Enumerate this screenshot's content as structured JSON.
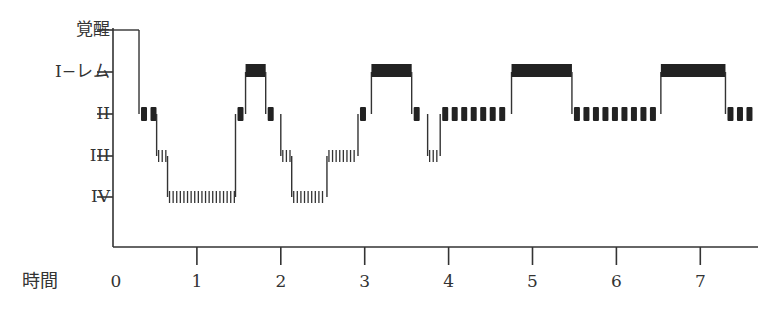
{
  "chart_data": {
    "type": "line",
    "subtype": "hypnogram (step)",
    "title": "",
    "xlabel": "時間",
    "ylabel": "",
    "x_ticks": [
      "0",
      "1",
      "2",
      "3",
      "4",
      "5",
      "6",
      "7"
    ],
    "xlim": [
      0,
      7.7
    ],
    "y_levels": [
      "覚醒",
      "I−レム",
      "II",
      "III",
      "IV"
    ],
    "grid": false,
    "legend": null,
    "segments": [
      {
        "stage": "覚醒",
        "start": 0.0,
        "end": 0.31
      },
      {
        "stage": "II",
        "start": 0.31,
        "end": 0.52
      },
      {
        "stage": "III",
        "start": 0.52,
        "end": 0.65
      },
      {
        "stage": "IV",
        "start": 0.65,
        "end": 1.46
      },
      {
        "stage": "II",
        "start": 1.46,
        "end": 1.58
      },
      {
        "stage": "I−レム",
        "start": 1.58,
        "end": 1.82
      },
      {
        "stage": "II",
        "start": 1.82,
        "end": 2.0
      },
      {
        "stage": "III",
        "start": 2.0,
        "end": 2.13
      },
      {
        "stage": "IV",
        "start": 2.13,
        "end": 2.55
      },
      {
        "stage": "III",
        "start": 2.55,
        "end": 2.92
      },
      {
        "stage": "II",
        "start": 2.92,
        "end": 3.08
      },
      {
        "stage": "I−レム",
        "start": 3.08,
        "end": 3.56
      },
      {
        "stage": "II",
        "start": 3.56,
        "end": 3.75
      },
      {
        "stage": "III",
        "start": 3.75,
        "end": 3.9
      },
      {
        "stage": "II",
        "start": 3.9,
        "end": 4.75
      },
      {
        "stage": "I−レム",
        "start": 4.75,
        "end": 5.47
      },
      {
        "stage": "II",
        "start": 5.47,
        "end": 6.53
      },
      {
        "stage": "I−レム",
        "start": 6.53,
        "end": 7.3
      },
      {
        "stage": "II",
        "start": 7.3,
        "end": 7.7
      }
    ]
  },
  "labels": {
    "y": [
      "覚醒",
      "I−レム",
      "II",
      "III",
      "IV"
    ],
    "x_title": "時間",
    "x_ticks": [
      "0",
      "1",
      "2",
      "3",
      "4",
      "5",
      "6",
      "7"
    ]
  }
}
